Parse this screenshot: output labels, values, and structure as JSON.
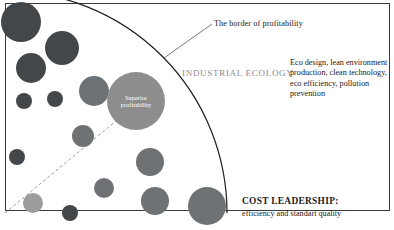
{
  "diagram": {
    "title_label": "INDUSTRIAL ECOLOGY",
    "callout_label": "The border of profitability",
    "center_bubble": {
      "line1": "Superior",
      "line2": "profitability",
      "text": "Superior profitability",
      "color": "#8d8d8d",
      "cx": 136,
      "cy": 101,
      "r": 29
    },
    "eco_practices": "Eco design, lean environment production, clean technology, eco efficiency, pollution prevention",
    "cost_leadership_title": "COST LEADERSHIP:",
    "cost_leadership_subtitle": "efficiency and standart quality",
    "colors": {
      "dark_bubble": "#44474a",
      "mid_bubble": "#6f7275",
      "light_bubble": "#8d8d8d",
      "lighter_bubble": "#9c9c9c",
      "arc_stroke": "#1f1f1f",
      "frame_stroke": "#3a3a3a",
      "dashed_line": "#9a9a9a",
      "callout_line": "#6a6a6a",
      "label_gray": "#8a8a8a",
      "text": "#1a1a1a",
      "background": "#ffffff"
    },
    "frame": {
      "x": 5,
      "y": 3,
      "width": 389,
      "height": 210
    },
    "arc": {
      "center_x": 5,
      "center_y": 213,
      "radius": 222
    },
    "callout_line": {
      "x1": 212,
      "y1": 24,
      "x2": 164,
      "y2": 58
    },
    "dashed_line": {
      "x1": 5,
      "y1": 213,
      "x2": 122,
      "y2": 116
    },
    "bubbles": [
      {
        "cx": 21,
        "cy": 22,
        "r": 20,
        "color": "#44474a"
      },
      {
        "cx": 62,
        "cy": 48,
        "r": 17,
        "color": "#44474a"
      },
      {
        "cx": 31,
        "cy": 68,
        "r": 15,
        "color": "#44474a"
      },
      {
        "cx": 94,
        "cy": 91,
        "r": 15,
        "color": "#6f7275"
      },
      {
        "cx": 24,
        "cy": 101,
        "r": 8,
        "color": "#44474a"
      },
      {
        "cx": 55,
        "cy": 99,
        "r": 8,
        "color": "#44474a"
      },
      {
        "cx": 83,
        "cy": 136,
        "r": 11,
        "color": "#6f7275"
      },
      {
        "cx": 17,
        "cy": 157,
        "r": 8,
        "color": "#44474a"
      },
      {
        "cx": 33,
        "cy": 203,
        "r": 10,
        "color": "#9c9c9c"
      },
      {
        "cx": 70,
        "cy": 213,
        "r": 8,
        "color": "#44474a"
      },
      {
        "cx": 104,
        "cy": 188,
        "r": 10,
        "color": "#6f7275"
      },
      {
        "cx": 150,
        "cy": 162,
        "r": 14,
        "color": "#6f7275"
      },
      {
        "cx": 155,
        "cy": 201,
        "r": 14,
        "color": "#6f7275"
      },
      {
        "cx": 207,
        "cy": 206,
        "r": 19,
        "color": "#6f7275"
      }
    ]
  }
}
